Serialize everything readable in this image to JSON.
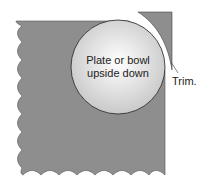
{
  "diagram": {
    "plate_label_line1": "Plate or bowl",
    "plate_label_line2": "upside down",
    "trim_label": "Trim.",
    "colors": {
      "fabric": "#8e8e8e",
      "plate_center": "#ffffff",
      "plate_edge": "#cfcfcf",
      "outline": "#333333"
    }
  }
}
